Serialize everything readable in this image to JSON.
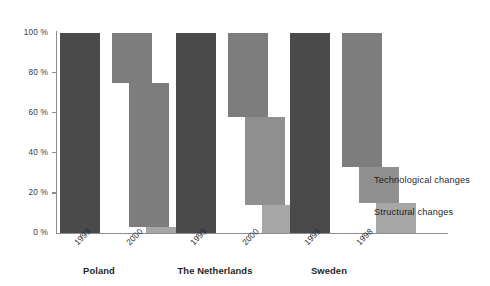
{
  "chart_data": {
    "type": "bar",
    "title": "",
    "subtitle": "",
    "xlabel": "",
    "ylabel": "",
    "ylim": [
      0,
      100
    ],
    "grid": false,
    "legend_position": "right",
    "y_ticks": [
      {
        "value": 100,
        "label": "100 %"
      },
      {
        "value": 80,
        "label": "80 %"
      },
      {
        "value": 60,
        "label": "60 %"
      },
      {
        "value": 40,
        "label": "40 %"
      },
      {
        "value": 20,
        "label": "20 %"
      },
      {
        "value": 0,
        "label": "0 %"
      }
    ],
    "categories": [
      "Poland",
      "The Netherlands",
      "Sweden"
    ],
    "legend": [
      {
        "name": "Technological changes",
        "color": "#7d7d7d"
      },
      {
        "name": "Structural changes",
        "color": "#a6a6a6"
      }
    ],
    "groups": [
      {
        "label": "Poland",
        "bars": [
          {
            "year": "1993",
            "kind": "baseline",
            "color": "#4a4a4a",
            "segments": [
              {
                "name": "total",
                "top": 100,
                "bottom": 0,
                "color": "#4a4a4a"
              }
            ]
          },
          {
            "year": "2000",
            "kind": "cascade",
            "segments": [
              {
                "name": "remaining",
                "top": 100,
                "bottom": 75,
                "color": "#7d7d7d"
              },
              {
                "name": "technological changes",
                "top": 75,
                "bottom": 3,
                "color": "#7d7d7d"
              },
              {
                "name": "structural changes",
                "top": 3,
                "bottom": 0,
                "color": "#a6a6a6"
              }
            ]
          }
        ]
      },
      {
        "label": "The Netherlands",
        "bars": [
          {
            "year": "1993",
            "kind": "baseline",
            "color": "#4a4a4a",
            "segments": [
              {
                "name": "total",
                "top": 100,
                "bottom": 0,
                "color": "#4a4a4a"
              }
            ]
          },
          {
            "year": "2000",
            "kind": "cascade",
            "segments": [
              {
                "name": "remaining",
                "top": 100,
                "bottom": 58,
                "color": "#7d7d7d"
              },
              {
                "name": "technological changes",
                "top": 58,
                "bottom": 14,
                "color": "#8f8f8f"
              },
              {
                "name": "structural changes",
                "top": 14,
                "bottom": 0,
                "color": "#a6a6a6"
              }
            ]
          }
        ]
      },
      {
        "label": "Sweden",
        "bars": [
          {
            "year": "1993",
            "kind": "baseline",
            "color": "#4a4a4a",
            "segments": [
              {
                "name": "total",
                "top": 100,
                "bottom": 0,
                "color": "#4a4a4a"
              }
            ]
          },
          {
            "year": "1998",
            "kind": "cascade",
            "segments": [
              {
                "name": "remaining",
                "top": 100,
                "bottom": 33,
                "color": "#7d7d7d"
              },
              {
                "name": "technological changes",
                "top": 33,
                "bottom": 15,
                "color": "#8f8f8f"
              },
              {
                "name": "structural changes",
                "top": 15,
                "bottom": 0,
                "color": "#a6a6a6"
              }
            ]
          }
        ]
      }
    ]
  },
  "legend": {
    "technological": "Technological changes",
    "structural": "Structural changes"
  }
}
